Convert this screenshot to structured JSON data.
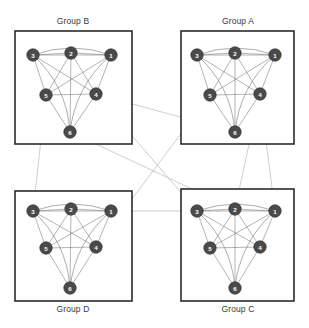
{
  "figure": {
    "title": "",
    "background_color": "#ffffff",
    "width": 309,
    "height": 328
  },
  "style": {
    "node_fill": "#4a4a4a",
    "node_stroke": "#2e2e2e",
    "node_label_color": "#ffffff",
    "intra_edge_color": "#6e6e6e",
    "inter_edge_color": "#b9b9b9",
    "panel_border_color": "#2b2b2b",
    "title_color": "#3a3a3a",
    "node_radius": 6.2
  },
  "panels": [
    {
      "id": "group-b",
      "label": "Group B",
      "title_position": "above",
      "box": {
        "x": 15,
        "y": 31,
        "w": 117,
        "h": 113
      },
      "title_xy": {
        "x": 73,
        "y": 24
      },
      "nodes": [
        {
          "id": "3",
          "label": "3",
          "x": 33,
          "y": 55
        },
        {
          "id": "2",
          "label": "2",
          "x": 71,
          "y": 53
        },
        {
          "id": "1",
          "label": "1",
          "x": 111,
          "y": 55
        },
        {
          "id": "5",
          "label": "5",
          "x": 46,
          "y": 95
        },
        {
          "id": "4",
          "label": "4",
          "x": 96,
          "y": 94
        },
        {
          "id": "6",
          "label": "6",
          "x": 70,
          "y": 132
        }
      ]
    },
    {
      "id": "group-a",
      "label": "Group A",
      "title_position": "above",
      "box": {
        "x": 181,
        "y": 31,
        "w": 113,
        "h": 113
      },
      "title_xy": {
        "x": 238,
        "y": 24
      },
      "nodes": [
        {
          "id": "3",
          "label": "3",
          "x": 197,
          "y": 55
        },
        {
          "id": "2",
          "label": "2",
          "x": 235,
          "y": 53
        },
        {
          "id": "1",
          "label": "1",
          "x": 275,
          "y": 55
        },
        {
          "id": "5",
          "label": "5",
          "x": 210,
          "y": 95
        },
        {
          "id": "4",
          "label": "4",
          "x": 260,
          "y": 94
        },
        {
          "id": "6",
          "label": "6",
          "x": 235,
          "y": 132
        }
      ]
    },
    {
      "id": "group-d",
      "label": "Group D",
      "title_position": "below",
      "box": {
        "x": 15,
        "y": 191,
        "w": 117,
        "h": 110
      },
      "title_xy": {
        "x": 73,
        "y": 312
      },
      "nodes": [
        {
          "id": "3",
          "label": "3",
          "x": 33,
          "y": 211
        },
        {
          "id": "2",
          "label": "2",
          "x": 71,
          "y": 209
        },
        {
          "id": "1",
          "label": "1",
          "x": 111,
          "y": 211
        },
        {
          "id": "5",
          "label": "5",
          "x": 46,
          "y": 248
        },
        {
          "id": "4",
          "label": "4",
          "x": 96,
          "y": 247
        },
        {
          "id": "6",
          "label": "6",
          "x": 70,
          "y": 288
        }
      ]
    },
    {
      "id": "group-c",
      "label": "Group C",
      "title_position": "below",
      "box": {
        "x": 181,
        "y": 189,
        "w": 113,
        "h": 112
      },
      "title_xy": {
        "x": 238,
        "y": 312
      },
      "nodes": [
        {
          "id": "3",
          "label": "3",
          "x": 197,
          "y": 211
        },
        {
          "id": "2",
          "label": "2",
          "x": 235,
          "y": 209
        },
        {
          "id": "1",
          "label": "1",
          "x": 275,
          "y": 211
        },
        {
          "id": "5",
          "label": "5",
          "x": 210,
          "y": 248
        },
        {
          "id": "4",
          "label": "4",
          "x": 260,
          "y": 247
        },
        {
          "id": "6",
          "label": "6",
          "x": 235,
          "y": 288
        }
      ]
    }
  ],
  "intra_edges": {
    "description": "complete graph K6 within each panel",
    "straight": [
      [
        "3",
        "2"
      ],
      [
        "2",
        "1"
      ],
      [
        "3",
        "5"
      ],
      [
        "1",
        "4"
      ],
      [
        "5",
        "4"
      ],
      [
        "3",
        "4"
      ],
      [
        "1",
        "5"
      ],
      [
        "2",
        "5"
      ],
      [
        "2",
        "4"
      ],
      [
        "2",
        "6"
      ],
      [
        "5",
        "6"
      ],
      [
        "4",
        "6"
      ],
      [
        "3",
        "1"
      ]
    ],
    "curved": [
      {
        "from": "3",
        "to": "1",
        "bow": -14
      },
      {
        "from": "3",
        "to": "6",
        "bow": -17
      },
      {
        "from": "1",
        "to": "6",
        "bow": 17
      }
    ]
  },
  "inter_edges": [
    {
      "from_panel": "group-a",
      "from_node": "6",
      "to_panel": "group-b",
      "to_node": "4",
      "arrow": true
    },
    {
      "from_panel": "group-c",
      "from_node": "3",
      "to_panel": "group-b",
      "to_node": "4",
      "arrow": true
    },
    {
      "from_panel": "group-d",
      "from_node": "4",
      "to_panel": "group-a",
      "to_node": "5",
      "arrow": true
    },
    {
      "from_panel": "group-c",
      "from_node": "2",
      "to_panel": "group-a",
      "to_node": "4",
      "arrow": true
    },
    {
      "from_panel": "group-b",
      "from_node": "5",
      "to_panel": "group-d",
      "to_node": "3",
      "arrow": true
    },
    {
      "from_panel": "group-b",
      "from_node": "6",
      "to_panel": "group-c",
      "to_node": "2",
      "arrow": true
    },
    {
      "from_panel": "group-a",
      "from_node": "4",
      "to_panel": "group-c",
      "to_node": "1",
      "arrow": true
    },
    {
      "from_panel": "group-d",
      "from_node": "1",
      "to_panel": "group-c",
      "to_node": "3",
      "arrow": true
    }
  ]
}
